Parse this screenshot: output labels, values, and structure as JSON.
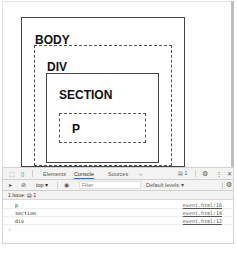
{
  "page": {
    "boxes": [
      {
        "label": "BODY",
        "style": "solid"
      },
      {
        "label": "DIV",
        "style": "dashed"
      },
      {
        "label": "SECTION",
        "style": "solid"
      },
      {
        "label": "P",
        "style": "dashed"
      }
    ]
  },
  "devtools": {
    "tabs": [
      {
        "label": "Elements",
        "active": false
      },
      {
        "label": "Console",
        "active": true
      },
      {
        "label": "Sources",
        "active": false
      }
    ],
    "more_tabs_icon": "»",
    "issues_badge": "1",
    "toolbar": {
      "context": "top",
      "filter_placeholder": "Filter",
      "levels": "Default levels"
    },
    "issues_bar": {
      "label": "1 Issue:",
      "count": "1"
    },
    "console_rows": [
      {
        "message": "p",
        "source": "event.html:16"
      },
      {
        "message": "section",
        "source": "event.html:14"
      },
      {
        "message": "div",
        "source": "event.html:12"
      }
    ],
    "prompt": "›"
  },
  "colors": {
    "active_tab_underline": "#1a73e8"
  }
}
